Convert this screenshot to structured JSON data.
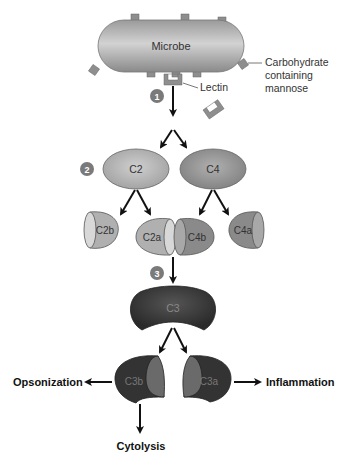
{
  "diagram": {
    "type": "lectin complement pathway",
    "microbe": {
      "label": "Microbe"
    },
    "annotations": {
      "carbohydrate": [
        "Carbohydrate",
        "containing",
        "mannose"
      ],
      "lectin": "Lectin"
    },
    "steps": [
      "1",
      "2",
      "3"
    ],
    "proteins": {
      "c2": "C2",
      "c4": "C4",
      "c2b": "C2b",
      "c2a": "C2a",
      "c4b": "C4b",
      "c4a": "C4a",
      "c3": "C3",
      "c3b": "C3b",
      "c3a": "C3a"
    },
    "outcomes": {
      "opsonization": "Opsonization",
      "inflammation": "Inflammation",
      "cytolysis": "Cytolysis"
    },
    "colors": {
      "microbe": "#a8a8a8",
      "receptor": "#8e8e8e",
      "c2": "#b8b8b8",
      "c4": "#9a9a9a",
      "c3": "#3a3a3a",
      "step_badge": "#7a7a7a",
      "arrow": "#111111"
    }
  }
}
